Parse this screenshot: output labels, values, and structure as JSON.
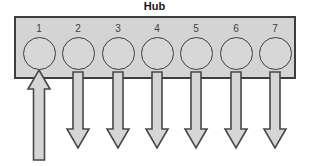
{
  "title": "Hub",
  "ports": [
    {
      "label": "1",
      "direction": "up",
      "arrow": "inbound-up-arrow"
    },
    {
      "label": "2",
      "direction": "down",
      "arrow": "outbound-down-arrow"
    },
    {
      "label": "3",
      "direction": "down",
      "arrow": "outbound-down-arrow"
    },
    {
      "label": "4",
      "direction": "down",
      "arrow": "outbound-down-arrow"
    },
    {
      "label": "5",
      "direction": "down",
      "arrow": "outbound-down-arrow"
    },
    {
      "label": "6",
      "direction": "down",
      "arrow": "outbound-down-arrow"
    },
    {
      "label": "7",
      "direction": "down",
      "arrow": "outbound-down-arrow"
    }
  ],
  "colors": {
    "box_fill": "#d4d4d4",
    "box_border": "#3e3e3e",
    "circle_fill": "#d7d7d7",
    "circle_border": "#3e3e3e",
    "arrow_fill": "#d5d5d5",
    "arrow_border": "#484848",
    "title_color": "#161616",
    "number_color": "#414141"
  }
}
